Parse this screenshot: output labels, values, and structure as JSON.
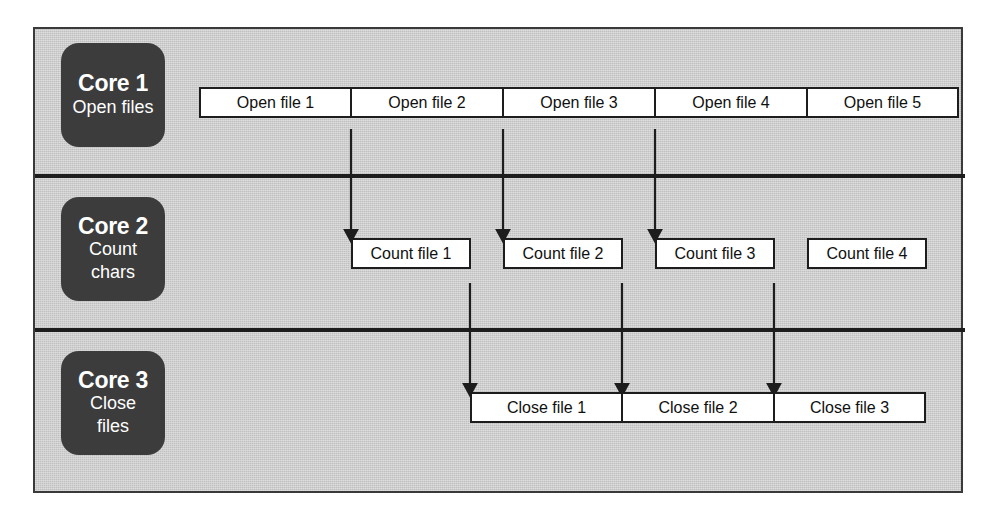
{
  "diagram": {
    "colors": {
      "background": "#ffffff",
      "panel": "#c9c9c9",
      "frame_border": "#3a3a3a",
      "lane_separator": "#1d1d1d",
      "core_badge": "#3c3c3c",
      "core_badge_text": "#ffffff",
      "task_box_fill": "#ffffff",
      "task_box_border": "#1d1d1d",
      "arrow": "#1d1d1d"
    },
    "lanes": [
      {
        "id": "core-1",
        "core_title": "Core 1",
        "core_subtitle_lines": [
          "Open files"
        ],
        "tasks": [
          {
            "label": "Open file 1"
          },
          {
            "label": "Open file 2"
          },
          {
            "label": "Open file 3"
          },
          {
            "label": "Open file 4"
          },
          {
            "label": "Open file 5"
          }
        ]
      },
      {
        "id": "core-2",
        "core_title": "Core 2",
        "core_subtitle_lines": [
          "Count",
          "chars"
        ],
        "tasks": [
          {
            "label": "Count file 1"
          },
          {
            "label": "Count file 2"
          },
          {
            "label": "Count file 3"
          },
          {
            "label": "Count file 4"
          }
        ]
      },
      {
        "id": "core-3",
        "core_title": "Core 3",
        "core_subtitle_lines": [
          "Close",
          "files"
        ],
        "tasks": [
          {
            "label": "Close file 1"
          },
          {
            "label": "Close file 2"
          },
          {
            "label": "Close file 3"
          }
        ]
      }
    ],
    "arrows": [
      {
        "id": "arrow-open1-count1",
        "from": "Open file 1",
        "to": "Count file 1",
        "x": 316,
        "y_start": 100,
        "y_end": 211
      },
      {
        "id": "arrow-open2-count2",
        "from": "Open file 2",
        "to": "Count file 2",
        "x": 468,
        "y_start": 100,
        "y_end": 211
      },
      {
        "id": "arrow-open3-count3",
        "from": "Open file 3",
        "to": "Count file 3",
        "x": 620,
        "y_start": 100,
        "y_end": 211
      },
      {
        "id": "arrow-count1-close1",
        "from": "Count file 1",
        "to": "Close file 1",
        "x": 435,
        "y_start": 254,
        "y_end": 365
      },
      {
        "id": "arrow-count2-close2",
        "from": "Count file 2",
        "to": "Close file 2",
        "x": 587,
        "y_start": 254,
        "y_end": 365
      },
      {
        "id": "arrow-count3-close3",
        "from": "Count file 3",
        "to": "Close file 3",
        "x": 739,
        "y_start": 254,
        "y_end": 365
      }
    ]
  }
}
